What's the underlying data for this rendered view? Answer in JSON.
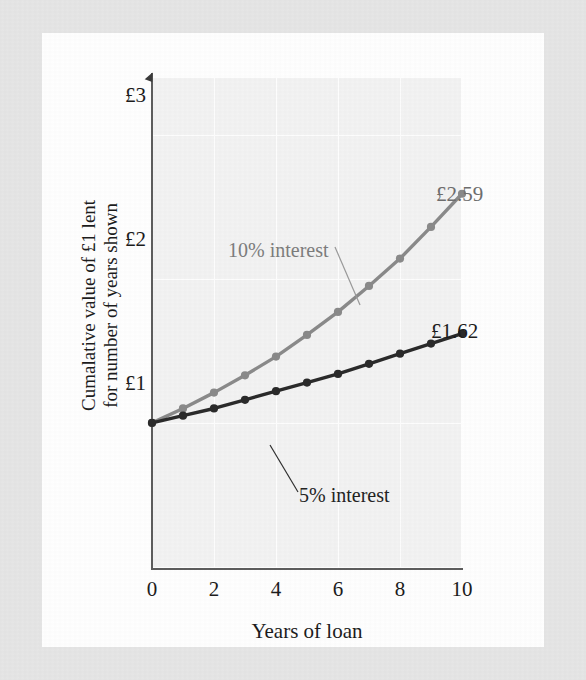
{
  "figure": {
    "x_axis_title": "Years of loan",
    "y_axis_title_line1": "Cumalative value of £1 lent",
    "y_axis_title_line2": "for number of years shown",
    "y_ticks": [
      "£1",
      "£2",
      "£3"
    ],
    "x_ticks": [
      "0",
      "2",
      "4",
      "6",
      "8",
      "10"
    ],
    "series_label_10": "10% interest",
    "series_label_5": "5% interest",
    "end_label_10": "£2.59",
    "end_label_5": "£1.62",
    "color_series_10": "#8a8a8a",
    "color_series_5": "#2a2a2a",
    "color_plot_bg": "#f3f3f3",
    "color_grid": "#ffffff",
    "color_axis": "#5d5d5d",
    "color_page": "#ffffff",
    "color_scan_border": "#e6e6e6"
  },
  "chart_data": {
    "type": "line",
    "title": "",
    "xlabel": "Years of loan",
    "ylabel": "Cumalative value of £1 lent for number of years shown",
    "xlim": [
      0,
      10
    ],
    "ylim": [
      0,
      3.4
    ],
    "xticks": [
      0,
      2,
      4,
      6,
      8,
      10
    ],
    "yticks": [
      1,
      2,
      3
    ],
    "ytick_labels": [
      "£1",
      "£2",
      "£3"
    ],
    "xtick_labels": [
      "0",
      "2",
      "4",
      "6",
      "8",
      "10"
    ],
    "grid": true,
    "grid_axis": "both",
    "legend": "annotations",
    "x": [
      0,
      1,
      2,
      3,
      4,
      5,
      6,
      7,
      8,
      9,
      10
    ],
    "series": [
      {
        "name": "10% interest",
        "color": "#8a8a8a",
        "marker": "circle",
        "values": [
          1.0,
          1.1,
          1.21,
          1.33,
          1.46,
          1.61,
          1.77,
          1.95,
          2.14,
          2.36,
          2.59
        ],
        "end_label": "£2.59"
      },
      {
        "name": "5% interest",
        "color": "#2a2a2a",
        "marker": "circle",
        "values": [
          1.0,
          1.05,
          1.1,
          1.16,
          1.22,
          1.28,
          1.34,
          1.41,
          1.48,
          1.55,
          1.62
        ],
        "end_label": "£1.62"
      }
    ],
    "annotations": [
      {
        "text": "10% interest",
        "points_to_series": "10% interest",
        "points_to_x": 6.0
      },
      {
        "text": "5% interest",
        "points_to_series": "5% interest",
        "points_to_x": 3.4
      },
      {
        "text": "£2.59",
        "points_to_series": "10% interest",
        "points_to_x": 10
      },
      {
        "text": "£1.62",
        "points_to_series": "5% interest",
        "points_to_x": 10
      }
    ]
  }
}
